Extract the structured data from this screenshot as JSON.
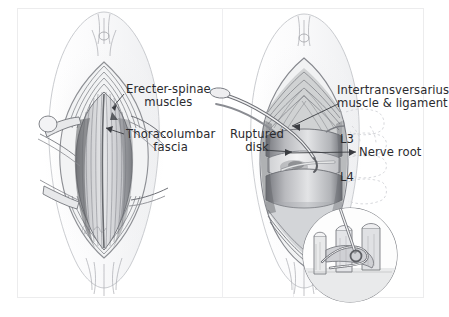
{
  "figure": {
    "type": "medical-illustration",
    "style": "graphite pencil drawing",
    "panel_count": 2
  },
  "left_panel": {
    "name": "superficial-exposure",
    "labels": [
      {
        "id": "erecter-spinae",
        "line1": "Erecter-spinae",
        "line2": "muscles"
      },
      {
        "id": "thoracolumbar-fascia",
        "line1": "Thoracolumbar",
        "line2": "fascia"
      }
    ],
    "signature": "artist-signature"
  },
  "right_panel": {
    "name": "deep-exposure",
    "labels": [
      {
        "id": "intertransversarius",
        "line1": "Intertransversarius",
        "line2": "muscle & ligament"
      },
      {
        "id": "ruptured-disk",
        "line1": "Ruptured",
        "line2": "disk"
      },
      {
        "id": "nerve-root",
        "line1": "Nerve root"
      }
    ],
    "vertebra_labels": [
      {
        "id": "l3",
        "text": "L3"
      },
      {
        "id": "l4",
        "text": "L4"
      }
    ],
    "inset": {
      "id": "magnified-detail",
      "shape": "circle"
    }
  },
  "colors": {
    "background": "#ffffff",
    "text": "#2a2a2e",
    "ink": "#6f7176",
    "ink_dark": "#3a3c41",
    "frame": "#ececed",
    "ghost": "#d8d9dd"
  }
}
